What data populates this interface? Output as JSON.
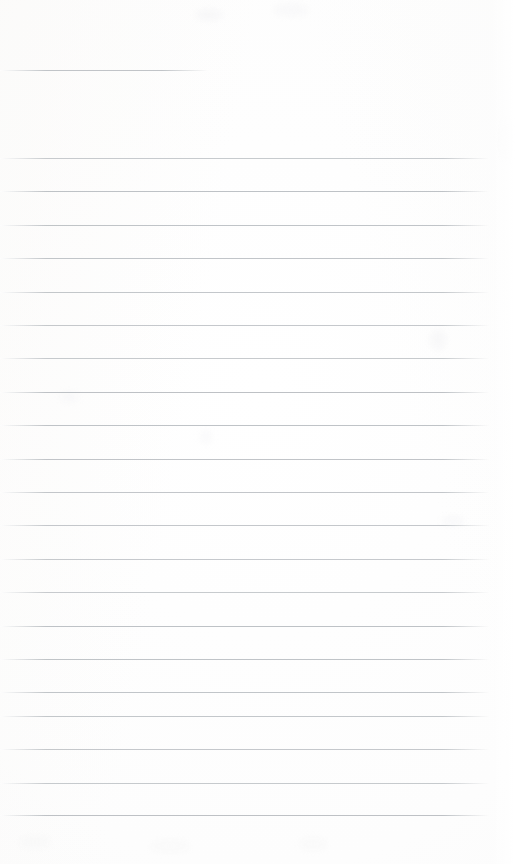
{
  "document": {
    "kind": "lined-paper-scan",
    "title": "Blank ruled notebook page",
    "visible_text": "",
    "page_width": 526,
    "page_height": 864,
    "background_color": "#fefeff",
    "rule_color": "#bcc0c4",
    "rule_thickness_px": 1
  },
  "ruling": {
    "left_edge_x": 0,
    "right_edge_x": 489,
    "line_spacing_px": 33.4,
    "first_body_line_y": 158,
    "last_body_line_y": 815,
    "bottom_blank_px": 49,
    "right_margin_px": 36,
    "header_rule": {
      "y": 70,
      "start_x": 0,
      "end_x": 208,
      "label": "header-rule"
    },
    "body_lines_y": [
      158,
      191.4,
      224.8,
      258.2,
      291.6,
      325,
      358.4,
      391.8,
      425.2,
      458.6,
      492,
      525.4,
      558.8,
      592.2,
      625.6,
      659,
      692.4,
      715.8,
      749.2,
      782.6,
      815
    ]
  },
  "texture": {
    "blotches": [
      {
        "x": 196,
        "y": 10,
        "w": 26,
        "h": 10,
        "color": "rgba(246,246,247,0.85)"
      },
      {
        "x": 274,
        "y": 4,
        "w": 34,
        "h": 12,
        "color": "rgba(248,248,249,0.8)"
      },
      {
        "x": 430,
        "y": 330,
        "w": 16,
        "h": 20,
        "color": "rgba(247,247,248,0.85)"
      },
      {
        "x": 442,
        "y": 516,
        "w": 22,
        "h": 10,
        "color": "rgba(248,248,249,0.8)"
      },
      {
        "x": 60,
        "y": 392,
        "w": 18,
        "h": 10,
        "color": "rgba(248,248,249,0.8)"
      },
      {
        "x": 200,
        "y": 430,
        "w": 12,
        "h": 14,
        "color": "rgba(249,249,250,0.8)"
      },
      {
        "x": 20,
        "y": 836,
        "w": 30,
        "h": 12,
        "color": "rgba(248,248,248,0.8)"
      },
      {
        "x": 150,
        "y": 840,
        "w": 40,
        "h": 12,
        "color": "rgba(249,249,249,0.8)"
      },
      {
        "x": 300,
        "y": 838,
        "w": 26,
        "h": 12,
        "color": "rgba(249,249,249,0.8)"
      },
      {
        "x": 500,
        "y": 120,
        "w": 18,
        "h": 40,
        "color": "rgba(249,249,249,0.75)"
      }
    ]
  }
}
